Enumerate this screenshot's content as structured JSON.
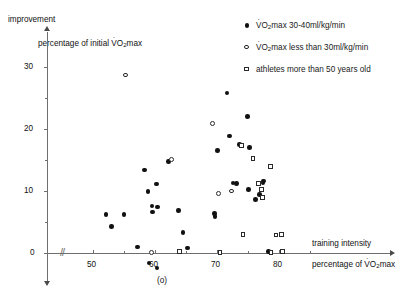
{
  "chart_data": {
    "type": "scatter",
    "title": "",
    "ylabel": "improvement",
    "ylabel_sub": "percentage of initial V̇O₂max",
    "xlabel": "training intensity",
    "xlabel_sub": "percentage of V̇O₂max",
    "xlim": [
      47,
      86
    ],
    "ylim": [
      -3,
      33
    ],
    "xticks": [
      50,
      55,
      60,
      65,
      70,
      75,
      80,
      85
    ],
    "xtick_labels": [
      "50",
      "",
      "60",
      "",
      "70",
      "",
      "80",
      ""
    ],
    "yticks": [
      0,
      5,
      10,
      15,
      20,
      25,
      30
    ],
    "ytick_labels": [
      "0",
      "",
      "10",
      "",
      "20",
      "",
      "30"
    ],
    "grid": false,
    "axis_break": "//",
    "legend_position": "top-right",
    "annotation_below_axis": "(o)",
    "series": [
      {
        "name": "V̇O₂max 30-40ml/kg/min",
        "marker": "filled-circle",
        "points": [
          [
            52.1,
            6.2
          ],
          [
            53.0,
            4.3
          ],
          [
            55.0,
            6.2
          ],
          [
            57.2,
            1.0
          ],
          [
            58.3,
            13.4
          ],
          [
            58.9,
            9.9
          ],
          [
            59.5,
            7.6
          ],
          [
            59.6,
            6.6
          ],
          [
            59.0,
            -1.6
          ],
          [
            60.2,
            11.1
          ],
          [
            60.4,
            7.4
          ],
          [
            60.3,
            -2.4
          ],
          [
            62.2,
            14.8
          ],
          [
            63.8,
            6.9
          ],
          [
            64.5,
            3.3
          ],
          [
            65.2,
            0.8
          ],
          [
            69.6,
            6.4
          ],
          [
            69.7,
            5.9
          ],
          [
            70.1,
            16.5
          ],
          [
            71.6,
            25.8
          ],
          [
            72.0,
            18.9
          ],
          [
            72.6,
            11.3
          ],
          [
            73.1,
            11.2
          ],
          [
            73.6,
            17.5
          ],
          [
            74.9,
            22.0
          ],
          [
            75.2,
            17.0
          ],
          [
            75.1,
            10.2
          ],
          [
            76.2,
            8.6
          ],
          [
            76.9,
            9.4
          ],
          [
            77.4,
            11.3
          ],
          [
            77.5,
            11.6
          ],
          [
            78.3,
            0.2
          ]
        ]
      },
      {
        "name": "V̇O₂max less than 30ml/kg/min",
        "marker": "open-circle",
        "points": [
          [
            55.2,
            28.7
          ],
          [
            59.4,
            0.1
          ],
          [
            62.7,
            15.1
          ],
          [
            69.3,
            20.9
          ],
          [
            70.2,
            9.6
          ],
          [
            72.4,
            10.0
          ]
        ]
      },
      {
        "name": "athletes more than 50 years old",
        "marker": "open-square",
        "points": [
          [
            63.9,
            0.2
          ],
          [
            70.5,
            0.1
          ],
          [
            73.9,
            17.4
          ],
          [
            74.2,
            3.0
          ],
          [
            75.8,
            15.3
          ],
          [
            76.7,
            11.2
          ],
          [
            77.2,
            10.3
          ],
          [
            77.4,
            9.0
          ],
          [
            78.6,
            14.0
          ],
          [
            78.7,
            0.1
          ],
          [
            79.5,
            2.9
          ],
          [
            80.4,
            3.0
          ],
          [
            80.6,
            0.2
          ]
        ]
      }
    ]
  },
  "axes": {
    "y_axis_label": "improvement",
    "y_axis_sublabel_pre": "percentage of initial ",
    "y_axis_sublabel_vo2": "V",
    "y_axis_sublabel_sub": "2",
    "y_axis_sublabel_post": "max",
    "x_axis_label": "training intensity",
    "x_axis_sublabel_pre": "percentage of ",
    "x_axis_sublabel_post": "max",
    "break_symbol": "//",
    "annotation": "(o)"
  },
  "legend": {
    "items": [
      {
        "symbol": "filled-circle",
        "pre": "",
        "vo2": "V",
        "sub": "2",
        "text": "max 30-40ml/kg/min"
      },
      {
        "symbol": "open-circle",
        "pre": "",
        "vo2": "V",
        "sub": "2",
        "text": "max less than 30ml/kg/min"
      },
      {
        "symbol": "open-square",
        "pre": "",
        "vo2": "",
        "sub": "",
        "text": "athletes more than 50 years old"
      }
    ]
  },
  "ticklabels": {
    "y": [
      "0",
      "10",
      "20",
      "30"
    ],
    "x": [
      "50",
      "60",
      "70",
      "80"
    ]
  },
  "colors": {
    "axis": "#6f6f6f",
    "marker": "#111111",
    "background": "#ffffff"
  }
}
